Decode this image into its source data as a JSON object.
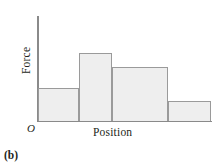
{
  "figure": {
    "panel_label": "(b)",
    "origin_label": "O",
    "axis_color": "#8a8a8a",
    "bar_fill": "#eeeeee",
    "bar_stroke": "#9a9a9a"
  },
  "chart_data": {
    "type": "bar",
    "title": "",
    "subtitle": "",
    "xlabel": "Position",
    "ylabel": "Force",
    "categories": [
      "1",
      "2",
      "3",
      "4"
    ],
    "values": [
      0.36,
      0.75,
      0.6,
      0.22
    ],
    "bar_widths": [
      0.24,
      0.19,
      0.32,
      0.25
    ],
    "xlim": [
      0,
      1
    ],
    "ylim": [
      0,
      1
    ],
    "grid": false,
    "legend": null,
    "annotations": [
      "O"
    ],
    "note": "Schematic force-vs-position bar graph; axes unlabeled with numeric ticks. Values are normalized bar heights read off the plot, widths are normalized bar spans.",
    "bars": [
      {
        "index": 0,
        "x_start": 0.0,
        "x_end": 0.24,
        "height": 0.36
      },
      {
        "index": 1,
        "x_start": 0.24,
        "x_end": 0.43,
        "height": 0.75
      },
      {
        "index": 2,
        "x_start": 0.43,
        "x_end": 0.75,
        "height": 0.6
      },
      {
        "index": 3,
        "x_start": 0.75,
        "x_end": 1.0,
        "height": 0.22
      }
    ]
  }
}
